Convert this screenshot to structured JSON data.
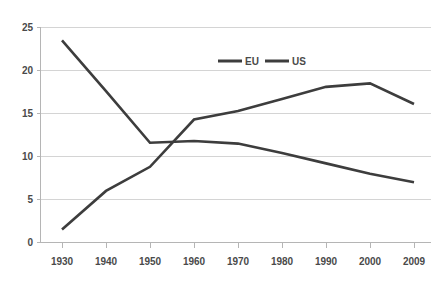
{
  "chart_data": {
    "type": "line",
    "title": "",
    "subtitle": "",
    "xlabel": "",
    "ylabel": "",
    "x": [
      "1930",
      "1940",
      "1950",
      "1960",
      "1970",
      "1980",
      "1990",
      "2000",
      "2009"
    ],
    "categories": [
      "1930",
      "1940",
      "1950",
      "1960",
      "1970",
      "1980",
      "1990",
      "2000",
      "2009"
    ],
    "series": [
      {
        "name": "EU",
        "color": "#3d3d3d",
        "values": [
          23.5,
          17.6,
          11.6,
          11.8,
          11.5,
          10.4,
          9.2,
          8.0,
          7.0
        ]
      },
      {
        "name": "US",
        "color": "#3d3d3d",
        "values": [
          1.5,
          6.0,
          8.8,
          14.3,
          15.3,
          16.7,
          18.1,
          18.5,
          16.1
        ]
      }
    ],
    "xlim": [
      0,
      8
    ],
    "ylim": [
      0,
      25
    ],
    "y_ticks": [
      0,
      5,
      10,
      15,
      20,
      25
    ],
    "x_ticks": [
      "1930",
      "1940",
      "1950",
      "1960",
      "1970",
      "1980",
      "1990",
      "2000",
      "2009"
    ],
    "grid": true,
    "grid_axis": "y",
    "legend": {
      "position": "top-center-inside",
      "entries": [
        "EU",
        "US"
      ]
    }
  },
  "axes": {
    "y_tick_labels": [
      "0",
      "5",
      "10",
      "15",
      "20",
      "25"
    ],
    "x_tick_labels": [
      "1930",
      "1940",
      "1950",
      "1960",
      "1970",
      "1980",
      "1990",
      "2000",
      "2009"
    ]
  },
  "legend": {
    "items": [
      {
        "label": "EU"
      },
      {
        "label": "US"
      }
    ]
  },
  "colors": {
    "line": "#3d3d3d",
    "grid": "#d4d4d4",
    "axis": "#b5b5b5",
    "text": "#4a4a4a",
    "background": "#ffffff"
  }
}
